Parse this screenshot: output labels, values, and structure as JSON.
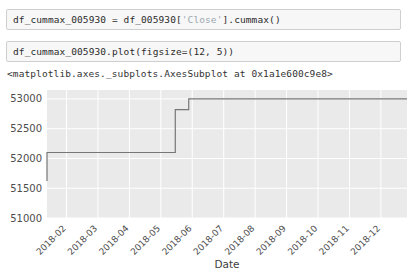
{
  "notebook": {
    "cells": [
      {
        "id": "cell-1",
        "code_prefix": "df_cummax_005930 = df_005930[",
        "code_string": "'Close'",
        "code_suffix": "].cummax()"
      },
      {
        "id": "cell-2",
        "code": "df_cummax_005930.plot(figsize=(12, 5))"
      }
    ],
    "output_text": "<matplotlib.axes._subplots.AxesSubplot at 0x1a1e600c9e8>"
  },
  "chart_data": {
    "type": "line",
    "title": "",
    "xlabel": "Date",
    "ylabel": "",
    "grid": true,
    "legend": false,
    "style": "ggplot-gray",
    "colors": {
      "line": "#767676",
      "axes_face": "#eaeaea",
      "grid": "#ffffff",
      "figure_face": "#ffffff",
      "tick_text": "#4d4d4d"
    },
    "ylim": [
      51000,
      53150
    ],
    "yticks": [
      51000,
      51500,
      52000,
      52500,
      53000
    ],
    "ytick_labels": [
      "51000",
      "51500",
      "52000",
      "52500",
      "53000"
    ],
    "xticks": [
      "2018-02",
      "2018-03",
      "2018-04",
      "2018-05",
      "2018-06",
      "2018-07",
      "2018-08",
      "2018-09",
      "2018-10",
      "2018-11",
      "2018-12"
    ],
    "xtick_labels": [
      "2018-02",
      "2018-03",
      "2018-04",
      "2018-05",
      "2018-06",
      "2018-07",
      "2018-08",
      "2018-09",
      "2018-10",
      "2018-11",
      "2018-12"
    ],
    "xtick_rotation": -45,
    "series": [
      {
        "name": "Close cummax",
        "x": [
          "2018-01-02",
          "2018-01-05",
          "2018-01-12",
          "2018-01-22",
          "2018-02-01",
          "2018-03-01",
          "2018-04-01",
          "2018-05-01",
          "2018-05-15",
          "2018-05-20",
          "2018-05-28",
          "2018-06-01",
          "2018-07-01",
          "2018-08-01",
          "2018-09-01",
          "2018-10-01",
          "2018-11-01",
          "2018-12-01",
          "2018-12-28"
        ],
        "values": [
          51620,
          51620,
          52100,
          52100,
          52100,
          52100,
          52100,
          52100,
          52820,
          52820,
          53000,
          53000,
          53000,
          53000,
          53000,
          53000,
          53000,
          53000,
          53000
        ]
      }
    ],
    "annotations": [
      "Monotonically non-decreasing cumulative maximum of the Close price.",
      "Starts near 51620, steps to 52100, then 52820, then plateaus at 53000."
    ]
  }
}
